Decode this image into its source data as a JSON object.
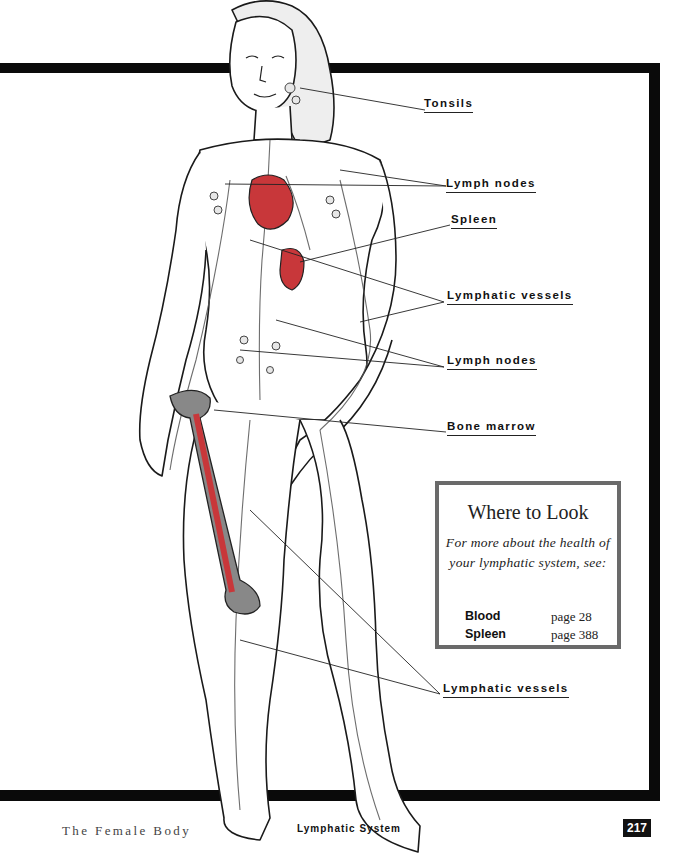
{
  "labels": {
    "tonsils": "Tonsils",
    "lymph_nodes_upper": "Lymph nodes",
    "spleen": "Spleen",
    "lymphatic_vessels_upper": "Lymphatic vessels",
    "lymph_nodes_lower": "Lymph nodes",
    "bone_marrow": "Bone marrow",
    "lymphatic_vessels_lower": "Lymphatic vessels"
  },
  "callout": {
    "title": "Where to Look",
    "body": "For more about the health of your lymphatic system, see:",
    "references": [
      {
        "topic": "Blood",
        "page": "page 28"
      },
      {
        "topic": "Spleen",
        "page": "page 388"
      }
    ]
  },
  "footer": {
    "book_title": "The Female Body",
    "chapter": "Lymphatic System",
    "page_number": "217"
  },
  "colors": {
    "frame": "#0a0a0a",
    "organ_red": "#c8373a",
    "callout_border": "#6a6a6a"
  }
}
